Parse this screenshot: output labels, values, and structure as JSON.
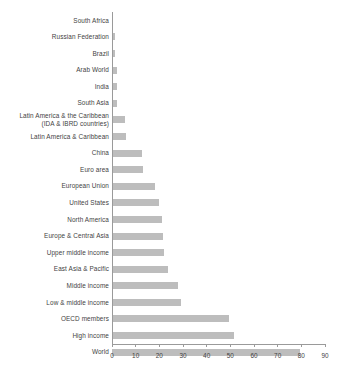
{
  "chart_data": {
    "type": "bar",
    "orientation": "horizontal",
    "title": "",
    "subtitle": "",
    "xlabel": "",
    "ylabel": "",
    "xlim": [
      0,
      90
    ],
    "ylim": null,
    "xticks": [
      0,
      10,
      20,
      30,
      40,
      50,
      60,
      70,
      80,
      90
    ],
    "xtick_labels": [
      "0",
      "10",
      "20",
      "30",
      "40",
      "50",
      "60",
      "70",
      "80",
      "90"
    ],
    "grid": false,
    "legend": null,
    "legend_position": "none",
    "bar_color": "#bdbdbd",
    "axis_color": "#9a9a9a",
    "text_color": "#3f3f3f",
    "categories": [
      "South Africa",
      "Russian Federation",
      "Brazil",
      "Arab World",
      "India",
      "South Asia",
      "Latin America & the Caribbean\n(IDA & IBRD countries)",
      "Latin America & Caribbean",
      "China",
      "Euro area",
      "European Union",
      "United States",
      "North America",
      "Europe & Central Asia",
      "Upper middle income",
      "East Asia & Pacific",
      "Middle income",
      "Low & middle income",
      "OECD members",
      "High income",
      "World"
    ],
    "values": [
      0.3,
      1.2,
      1.4,
      2.0,
      2.1,
      2.3,
      5.7,
      6.0,
      12.5,
      13.0,
      18.0,
      20.0,
      21.0,
      21.5,
      22.0,
      23.5,
      28.0,
      29.0,
      49.5,
      51.5,
      79.5
    ]
  }
}
